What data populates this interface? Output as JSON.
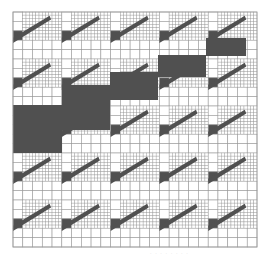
{
  "figure": {
    "grid": {
      "x": 13,
      "y": 12,
      "width": 244,
      "height": 235,
      "blocks_x": 5,
      "blocks_y": 5
    },
    "colors": {
      "line": "#9a9a9a",
      "fill": "#ffffff",
      "dark": "#505050"
    },
    "band": [
      {
        "x": 13,
        "y": 105,
        "w": 49,
        "h": 48
      },
      {
        "x": 62,
        "y": 85,
        "w": 48,
        "h": 45
      },
      {
        "x": 110,
        "y": 72,
        "w": 48,
        "h": 28
      },
      {
        "x": 158,
        "y": 55,
        "w": 48,
        "h": 22
      },
      {
        "x": 206,
        "y": 38,
        "w": 40,
        "h": 18
      }
    ],
    "caption": "· · · · · · · ·"
  }
}
